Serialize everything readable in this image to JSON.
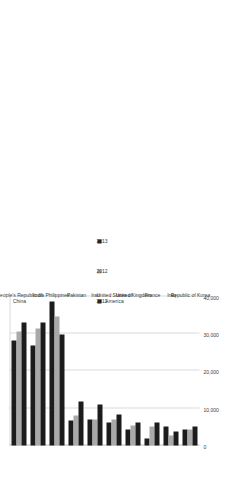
{
  "chart_data": {
    "type": "bar",
    "orientation": "horizontal",
    "title": "",
    "xlabel": "",
    "ylabel": "",
    "xlim": [
      0,
      40000
    ],
    "grid": true,
    "legend_position": "inside-right",
    "tick_labels": [
      "0",
      "10,000",
      "20,000",
      "30,000",
      "40,000"
    ],
    "tick_values": [
      0,
      10000,
      20000,
      30000,
      40000
    ],
    "categories": [
      "People's Republic of China",
      "India",
      "Philippines",
      "Pakistan",
      "Iran",
      "United States of America",
      "United Kingdom",
      "France",
      "Iraq",
      "Republic of Korea"
    ],
    "series": [
      {
        "name": "2011",
        "color": "#1c1c1c",
        "values": [
          28200,
          26800,
          38700,
          6700,
          7000,
          6200,
          4200,
          1800,
          5000,
          4300
        ]
      },
      {
        "name": "2012",
        "color": "#a9a9a9",
        "values": [
          30500,
          31300,
          34700,
          8100,
          6900,
          7100,
          5400,
          5000,
          2700,
          4400
        ]
      },
      {
        "name": "2013",
        "color": "#1c1c1c",
        "values": [
          33000,
          32900,
          29700,
          11800,
          11000,
          8300,
          6300,
          6300,
          3800,
          5100
        ]
      }
    ]
  },
  "legend": {
    "items": [
      {
        "label": "2011",
        "color": "#1c1c1c"
      },
      {
        "label": "2012",
        "color": "#a9a9a9"
      },
      {
        "label": "2013",
        "color": "#1c1c1c"
      }
    ]
  }
}
